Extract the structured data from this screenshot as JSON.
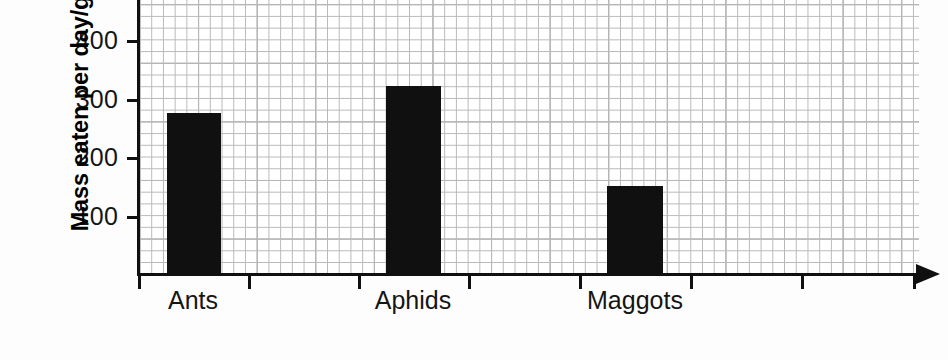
{
  "chart_data": {
    "type": "bar",
    "title": "",
    "xlabel": "",
    "ylabel": "Mass eaten per day/g",
    "categories": [
      "Ants",
      "Aphids",
      "Maggots"
    ],
    "values": [
      275,
      320,
      150
    ],
    "ylim": [
      0,
      440
    ],
    "y_ticks": [
      100,
      200,
      300,
      400
    ],
    "y_tick_labels": [
      "100",
      "200",
      "300",
      "400"
    ],
    "grid": true,
    "grid_style": "graph-paper",
    "legend": "none",
    "bar_color": "#101010",
    "axis_color": "#101010",
    "grid_color": "#8e8e8e",
    "minor_grid_color": "#b9b9b9",
    "background": "#ffffff",
    "x_axis_has_arrow": true,
    "x_tick_count": 8
  },
  "axis": {
    "y_title": "Mass eaten per day/g",
    "tick_400": "400",
    "tick_300": "300",
    "tick_200": "200",
    "tick_100": "100"
  },
  "categories": {
    "ants": "Ants",
    "aphids": "Aphids",
    "maggots": "Maggots"
  }
}
